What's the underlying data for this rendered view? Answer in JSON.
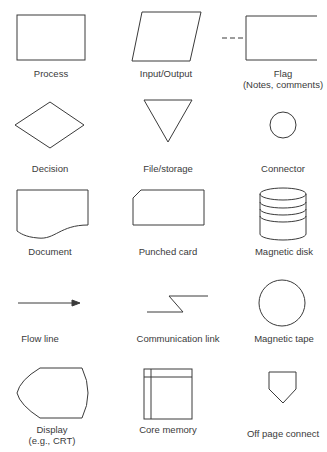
{
  "symbols": [
    {
      "name": "Process",
      "sub": ""
    },
    {
      "name": "Input/Output",
      "sub": ""
    },
    {
      "name": "Flag",
      "sub": "(Notes, comments)"
    },
    {
      "name": "Decision",
      "sub": ""
    },
    {
      "name": "File/storage",
      "sub": ""
    },
    {
      "name": "Connector",
      "sub": ""
    },
    {
      "name": "Document",
      "sub": ""
    },
    {
      "name": "Punched card",
      "sub": ""
    },
    {
      "name": "Magnetic disk",
      "sub": ""
    },
    {
      "name": "Flow line",
      "sub": ""
    },
    {
      "name": "Communication link",
      "sub": ""
    },
    {
      "name": "Magnetic tape",
      "sub": ""
    },
    {
      "name": "Display",
      "sub": "(e.g., CRT)"
    },
    {
      "name": "Core memory",
      "sub": ""
    },
    {
      "name": "Off page connect",
      "sub": ""
    }
  ],
  "colors": {
    "stroke": "#3a3a3a",
    "background": "#ffffff"
  }
}
